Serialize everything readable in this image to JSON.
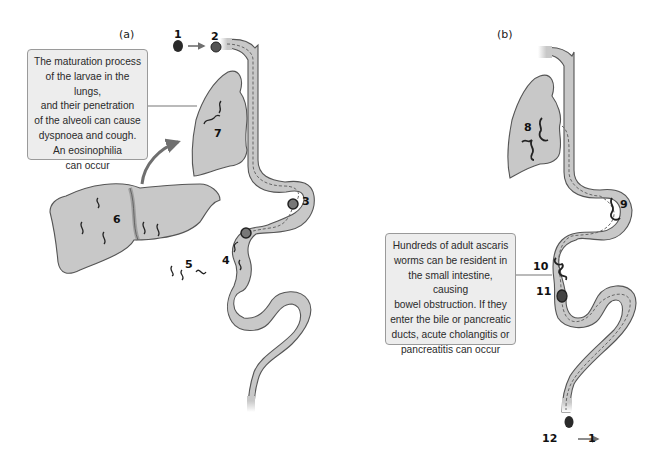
{
  "panels": {
    "a": {
      "label": "(a)"
    },
    "b": {
      "label": "(b)"
    }
  },
  "callouts": {
    "a": {
      "lines": [
        "The maturation process",
        "of the larvae in the lungs,",
        "and their penetration",
        "of the alveoli can cause",
        "dyspnoea and cough.",
        "An eosinophilia",
        "can occur"
      ]
    },
    "b": {
      "lines": [
        "Hundreds of adult ascaris",
        "worms can be resident in",
        "the small intestine, causing",
        "bowel obstruction. If they",
        "enter the bile or pancreatic",
        "ducts, acute cholangitis or",
        "pancreatitis can occur"
      ]
    }
  },
  "stages": {
    "s1": "1",
    "s2": "2",
    "s3": "3",
    "s4": "4",
    "s5": "5",
    "s6": "6",
    "s7": "7",
    "s8": "8",
    "s9": "9",
    "s10": "10",
    "s11": "11",
    "s12": "12",
    "s12_arrow_target": "1"
  },
  "icons": {
    "egg": "ascaris-egg-icon",
    "larva": "larva-worm-icon",
    "arrow": "cycle-arrow-icon"
  },
  "colors": {
    "organ_fill": "#c8c8c8",
    "organ_stroke": "#555555",
    "callout_fill": "#ededed",
    "arrow": "#6f6f6f",
    "worm": "#222222"
  }
}
